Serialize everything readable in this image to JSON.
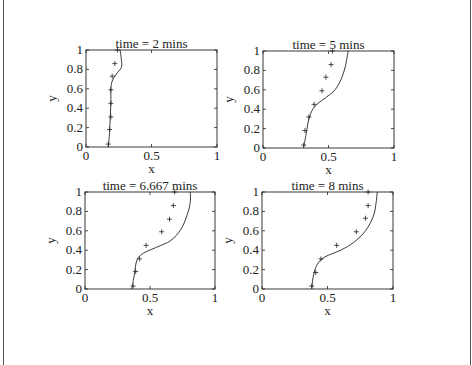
{
  "chart_data": [
    {
      "type": "line",
      "title": "time = 2 mins",
      "xlabel": "x",
      "ylabel": "y",
      "xlim": [
        0,
        1
      ],
      "ylim": [
        0,
        1
      ],
      "xticks": [
        "0",
        "0.5",
        "1"
      ],
      "yticks": [
        "0",
        "0.2",
        "0.4",
        "0.6",
        "0.8",
        "1"
      ],
      "grid": false,
      "series": [
        {
          "name": "model",
          "style": "line",
          "x": [
            0.17,
            0.18,
            0.185,
            0.19,
            0.19,
            0.2,
            0.23,
            0.27,
            0.27,
            0.26
          ],
          "y": [
            0.0,
            0.15,
            0.3,
            0.45,
            0.6,
            0.68,
            0.75,
            0.82,
            0.9,
            1.0
          ]
        },
        {
          "name": "data",
          "style": "plus",
          "x": [
            0.17,
            0.18,
            0.19,
            0.19,
            0.19,
            0.2,
            0.22,
            0.24
          ],
          "y": [
            0.03,
            0.18,
            0.31,
            0.45,
            0.59,
            0.73,
            0.86,
            1.0
          ]
        }
      ]
    },
    {
      "type": "line",
      "title": "time = 5 mins",
      "xlabel": "x",
      "ylabel": "y",
      "xlim": [
        0,
        1
      ],
      "ylim": [
        0,
        1
      ],
      "xticks": [
        "0",
        "0.5",
        "1"
      ],
      "yticks": [
        "0",
        "0.2",
        "0.4",
        "0.6",
        "0.8",
        "1"
      ],
      "grid": false,
      "series": [
        {
          "name": "model",
          "style": "line",
          "x": [
            0.31,
            0.33,
            0.35,
            0.38,
            0.42,
            0.48,
            0.55,
            0.6,
            0.63,
            0.65
          ],
          "y": [
            0.0,
            0.15,
            0.3,
            0.4,
            0.46,
            0.52,
            0.6,
            0.72,
            0.85,
            1.0
          ]
        },
        {
          "name": "data",
          "style": "plus",
          "x": [
            0.31,
            0.32,
            0.35,
            0.39,
            0.45,
            0.48,
            0.52,
            0.53
          ],
          "y": [
            0.03,
            0.18,
            0.32,
            0.45,
            0.59,
            0.73,
            0.86,
            1.0
          ]
        }
      ]
    },
    {
      "type": "line",
      "title": "time = 6.667 mins",
      "xlabel": "x",
      "ylabel": "y",
      "xlim": [
        0,
        1
      ],
      "ylim": [
        0,
        1
      ],
      "xticks": [
        "0",
        "0.5",
        "1"
      ],
      "yticks": [
        "0",
        "0.2",
        "0.4",
        "0.6",
        "0.8",
        "1"
      ],
      "grid": false,
      "series": [
        {
          "name": "model",
          "style": "line",
          "x": [
            0.36,
            0.38,
            0.4,
            0.45,
            0.55,
            0.66,
            0.74,
            0.79,
            0.81,
            0.81
          ],
          "y": [
            0.0,
            0.15,
            0.3,
            0.37,
            0.43,
            0.5,
            0.62,
            0.78,
            0.9,
            1.0
          ]
        },
        {
          "name": "data",
          "style": "plus",
          "x": [
            0.37,
            0.39,
            0.42,
            0.47,
            0.59,
            0.65,
            0.68,
            0.69
          ],
          "y": [
            0.03,
            0.18,
            0.31,
            0.45,
            0.59,
            0.72,
            0.86,
            1.0
          ]
        }
      ]
    },
    {
      "type": "line",
      "title": "time = 8 mins",
      "xlabel": "x",
      "ylabel": "y",
      "xlim": [
        0,
        1
      ],
      "ylim": [
        0,
        1
      ],
      "xticks": [
        "0",
        "0.5",
        "1"
      ],
      "yticks": [
        "0",
        "0.2",
        "0.4",
        "0.6",
        "0.8",
        "1"
      ],
      "grid": false,
      "series": [
        {
          "name": "model",
          "style": "line",
          "x": [
            0.38,
            0.39,
            0.42,
            0.48,
            0.6,
            0.7,
            0.79,
            0.85,
            0.87,
            0.88
          ],
          "y": [
            0.0,
            0.12,
            0.25,
            0.33,
            0.4,
            0.48,
            0.6,
            0.75,
            0.88,
            1.0
          ]
        },
        {
          "name": "data",
          "style": "plus",
          "x": [
            0.38,
            0.41,
            0.45,
            0.57,
            0.72,
            0.79,
            0.81,
            0.81
          ],
          "y": [
            0.03,
            0.17,
            0.31,
            0.45,
            0.59,
            0.73,
            0.86,
            1.0
          ]
        }
      ]
    }
  ],
  "layout": {
    "axes": [
      {
        "left": 86,
        "top": 50,
        "width": 131,
        "height": 97
      },
      {
        "left": 263,
        "top": 51,
        "width": 131,
        "height": 97
      },
      {
        "left": 85,
        "top": 192,
        "width": 130,
        "height": 97
      },
      {
        "left": 262,
        "top": 192,
        "width": 131,
        "height": 97
      }
    ],
    "line_color": "#222222",
    "marker_color": "#222222"
  }
}
